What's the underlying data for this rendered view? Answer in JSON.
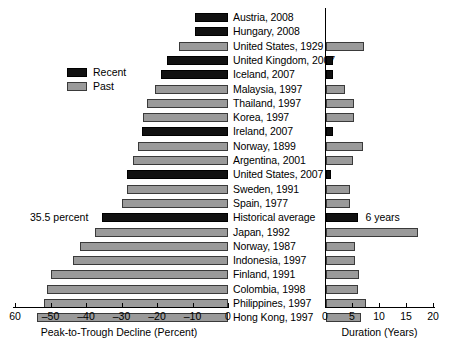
{
  "chart_data": {
    "type": "bar",
    "title": "",
    "orientation": "horizontal",
    "panels": [
      {
        "name": "decline",
        "xlabel": "Peak-to-Trough Decline (Percent)",
        "ticks": [
          -60,
          -50,
          -40,
          -30,
          -20,
          -10,
          0
        ],
        "tick_labels": [
          "60",
          "–50",
          "–40",
          "–30",
          "–20",
          "–10",
          "0"
        ],
        "xlim": [
          -60,
          0
        ]
      },
      {
        "name": "duration",
        "xlabel": "Duration (Years)",
        "ticks": [
          0,
          5,
          10,
          15,
          20
        ],
        "tick_labels": [
          "0",
          "5",
          "10",
          "15",
          "20"
        ],
        "xlim": [
          0,
          20
        ]
      }
    ],
    "legend": {
      "position": "upper-left",
      "entries": [
        {
          "label": "Recent",
          "color": "#111111",
          "key": "recent"
        },
        {
          "label": "Past",
          "color": "#9a9a9a",
          "key": "past"
        }
      ]
    },
    "annotations": [
      {
        "text": "35.5 percent",
        "target_row": "Historical average",
        "side": "left"
      },
      {
        "text": "6 years",
        "target_row": "Historical average",
        "side": "right"
      }
    ],
    "categories": [
      "Austria, 2008",
      "Hungary, 2008",
      "United States, 1929",
      "United Kingdom, 2007",
      "Iceland, 2007",
      "Malaysia, 1997",
      "Thailand, 1997",
      "Korea, 1997",
      "Ireland, 2007",
      "Norway, 1899",
      "Argentina, 2001",
      "United States, 2007",
      "Sweden, 1991",
      "Spain, 1977",
      "Historical average",
      "Japan, 1992",
      "Norway, 1987",
      "Indonesia, 1997",
      "Finland, 1991",
      "Colombia, 1998",
      "Philippines, 1997",
      "Hong Kong, 1997"
    ],
    "rows": [
      {
        "label": "Austria, 2008",
        "group": "recent",
        "decline": -9.3,
        "duration": 0.0
      },
      {
        "label": "Hungary, 2008",
        "group": "recent",
        "decline": -9.3,
        "duration": 0.0
      },
      {
        "label": "United States, 1929",
        "group": "past",
        "decline": -13.8,
        "duration": 7.0
      },
      {
        "label": "United Kingdom, 2007",
        "group": "recent",
        "decline": -17.2,
        "duration": 1.3
      },
      {
        "label": "Iceland, 2007",
        "group": "recent",
        "decline": -18.9,
        "duration": 1.3
      },
      {
        "label": "Malaysia, 1997",
        "group": "past",
        "decline": -20.6,
        "duration": 3.5
      },
      {
        "label": "Thailand, 1997",
        "group": "past",
        "decline": -22.8,
        "duration": 5.2
      },
      {
        "label": "Korea, 1997",
        "group": "past",
        "decline": -23.9,
        "duration": 5.2
      },
      {
        "label": "Ireland, 2007",
        "group": "recent",
        "decline": -24.2,
        "duration": 1.3
      },
      {
        "label": "Norway, 1899",
        "group": "past",
        "decline": -25.4,
        "duration": 6.8
      },
      {
        "label": "Argentina, 2001",
        "group": "past",
        "decline": -26.8,
        "duration": 5.0
      },
      {
        "label": "United States, 2007",
        "group": "recent",
        "decline": -28.5,
        "duration": 1.0
      },
      {
        "label": "Sweden, 1991",
        "group": "past",
        "decline": -28.5,
        "duration": 4.5
      },
      {
        "label": "Spain, 1977",
        "group": "past",
        "decline": -29.9,
        "duration": 4.5
      },
      {
        "label": "Historical average",
        "group": "recent",
        "decline": -35.5,
        "duration": 6.0
      },
      {
        "label": "Japan, 1992",
        "group": "past",
        "decline": -37.5,
        "duration": 17.0
      },
      {
        "label": "Norway, 1987",
        "group": "past",
        "decline": -41.7,
        "duration": 5.4
      },
      {
        "label": "Indonesia, 1997",
        "group": "past",
        "decline": -43.7,
        "duration": 5.4
      },
      {
        "label": "Finland, 1991",
        "group": "past",
        "decline": -49.9,
        "duration": 6.2
      },
      {
        "label": "Colombia, 1998",
        "group": "past",
        "decline": -51.0,
        "duration": 6.0
      },
      {
        "label": "Philippines, 1997",
        "group": "past",
        "decline": -51.8,
        "duration": 7.4
      },
      {
        "label": "Hong Kong, 1997",
        "group": "past",
        "decline": -53.8,
        "duration": 6.4
      }
    ]
  }
}
